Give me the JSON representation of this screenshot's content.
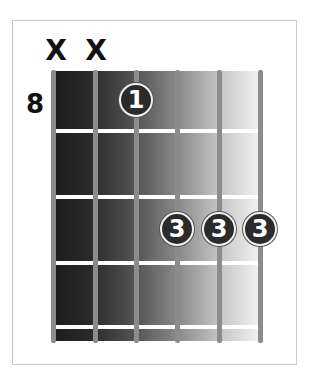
{
  "chord_diagram": {
    "start_fret_label": "8",
    "string_count": 6,
    "muted_strings": [
      {
        "string": 1,
        "symbol": "X"
      },
      {
        "string": 2,
        "symbol": "X"
      }
    ],
    "fingers": [
      {
        "string": 3,
        "fret_row": 1,
        "finger": "1"
      },
      {
        "string": 4,
        "fret_row": 3,
        "finger": "3"
      },
      {
        "string": 5,
        "fret_row": 3,
        "finger": "3"
      },
      {
        "string": 6,
        "fret_row": 3,
        "finger": "3"
      }
    ],
    "colors": {
      "gradient_dark": "#1c1c1c",
      "gradient_light": "#f4f4f4",
      "string": "#8c8c8c",
      "fret": "#ffffff",
      "finger_fill": "#2b2b2b",
      "finger_text": "#ffffff"
    }
  }
}
